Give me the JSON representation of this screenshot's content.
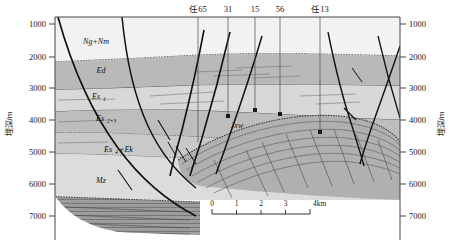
{
  "figure": {
    "type": "geological-cross-section",
    "axis_left_label": "埋深/m",
    "axis_right_label": "埋深/m",
    "depth_ticks": [
      "1000",
      "2000",
      "3000",
      "4000",
      "5000",
      "6000",
      "7000"
    ],
    "depth_unit": "m",
    "depth_min": 1000,
    "depth_max": 7000
  },
  "wells": [
    {
      "label": "任65",
      "x": 198
    },
    {
      "label": "31",
      "x": 228
    },
    {
      "label": "15",
      "x": 255
    },
    {
      "label": "56",
      "x": 280
    },
    {
      "label": "任13",
      "x": 320
    }
  ],
  "units": [
    {
      "label": "Ng+Nm",
      "sub": "",
      "x": 96,
      "y": 44,
      "color": "#f2f2f2"
    },
    {
      "label": "Ed",
      "sub": "",
      "x": 101,
      "y": 73,
      "color": "#b9b9b9"
    },
    {
      "label": "Es",
      "sub": "1",
      "x": 98,
      "y": 99,
      "color": "#d8d8d8"
    },
    {
      "label": "Es",
      "sub": "2+3",
      "x": 102,
      "y": 121,
      "color": "#bdbdbd"
    },
    {
      "label": "Es",
      "sub": "4",
      "suffix": "+Ek",
      "x": 114,
      "y": 152,
      "color": "#c9c9c9"
    },
    {
      "label": "Mz",
      "sub": "",
      "x": 101,
      "y": 183,
      "color": "#dcdcdc"
    },
    {
      "label": "Jxw",
      "sub": "",
      "x": 237,
      "y": 128,
      "color": "#b0b0b0"
    }
  ],
  "scale_bar": {
    "ticks": [
      "0",
      "1",
      "2",
      "3"
    ],
    "end_label": "4km",
    "x": 212,
    "y": 204,
    "width": 98
  },
  "colors": {
    "neogene": "#f2f2f2",
    "dongying": "#b9b9b9",
    "shahejie1": "#d8d8d8",
    "shahejie23": "#bdbdbd",
    "shahejie4_kongdian": "#c9c9c9",
    "mesozoic": "#dcdcdc",
    "jixianian": "#b0b0b0",
    "basement": "#9e9e9e",
    "fault": "#111111",
    "bedding": "#6a6a6a",
    "axis": "#555555"
  }
}
